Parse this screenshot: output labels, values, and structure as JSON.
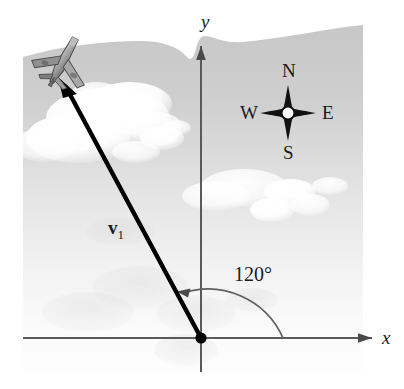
{
  "figure": {
    "kind": "vector-diagram",
    "axes": {
      "x_label": "x",
      "y_label": "y",
      "origin_label": ""
    },
    "vector": {
      "label_text": "v",
      "label_subscript": "1",
      "angle_label": "120°"
    },
    "compass": {
      "north": "N",
      "south": "S",
      "east": "E",
      "west": "W"
    },
    "icons": {
      "airplane": "airplane-icon",
      "compass_rose": "compass-rose-icon",
      "origin_point": "origin-dot-icon"
    },
    "colors": {
      "sky_top": "#c8c8c8",
      "sky_bottom": "#fbfbfb",
      "cloud": "#ffffff",
      "axis": "#555555",
      "vector": "#000000",
      "arc": "#5a5a5a",
      "text": "#1a1a1a",
      "plane_body": "#9a9a9a",
      "plane_dark": "#5c5c5c"
    },
    "geometry": {
      "origin_x": 201,
      "origin_y": 338,
      "vector_tip_x": 58,
      "vector_tip_y": 78,
      "x_axis_left": 23,
      "x_axis_right": 380,
      "y_axis_top": 45,
      "arc_radius": 82
    }
  }
}
